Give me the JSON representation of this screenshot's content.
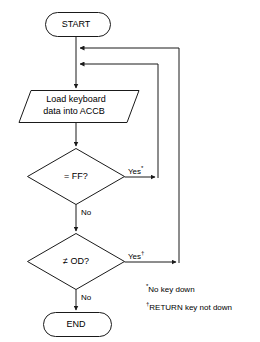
{
  "diagram": {
    "line_color": "#1a1a1a",
    "background": "#ffffff",
    "nodes": {
      "start": {
        "label": "START",
        "shape": "terminator"
      },
      "io_load": {
        "label_line1": "Load keyboard",
        "label_line2": "data into ACCB",
        "shape": "parallelogram"
      },
      "decision_ff": {
        "label": "= FF?",
        "shape": "diamond"
      },
      "decision_od": {
        "label": "≠ OD?",
        "shape": "diamond"
      },
      "end": {
        "label": "END",
        "shape": "terminator"
      }
    },
    "edge_labels": {
      "ff_yes": "Yes",
      "ff_yes_marker": "*",
      "ff_no": "No",
      "od_yes": "Yes",
      "od_yes_marker": "†",
      "od_no": "No"
    },
    "footnotes": [
      {
        "marker": "*",
        "text": "No key down"
      },
      {
        "marker": "†",
        "text": "RETURN key not down"
      }
    ]
  }
}
